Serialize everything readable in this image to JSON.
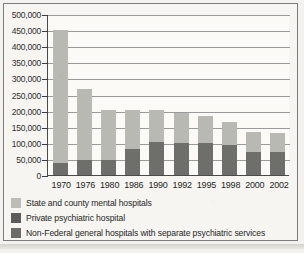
{
  "chart_data": {
    "type": "bar",
    "subtype": "stacked-bar",
    "title": "",
    "xlabel": "",
    "ylabel": "",
    "ylim": [
      0,
      500000
    ],
    "ytick_labels": [
      "500,000",
      "450,000",
      "400,000",
      "350,000",
      "300,000",
      "250,000",
      "200,000",
      "150,000",
      "100,000",
      "50,000",
      "0"
    ],
    "ytick_values": [
      500000,
      450000,
      400000,
      350000,
      300000,
      250000,
      200000,
      150000,
      100000,
      50000,
      0
    ],
    "grid": true,
    "legend_position": "below",
    "categories": [
      "1970",
      "1976",
      "1980",
      "1986",
      "1990",
      "1992",
      "1995",
      "1998",
      "2000",
      "2002"
    ],
    "series": [
      {
        "name": "Non-Federal general hospitals with separate psychiatric services",
        "color": "#6e6e6b",
        "values": [
          38000,
          48000,
          48000,
          80000,
          102000,
          99000,
          100000,
          93000,
          72000,
          73000
        ]
      },
      {
        "name": "State and county mental hospitals",
        "color": "#b9b9b4",
        "values": [
          412000,
          220000,
          155000,
          123000,
          101000,
          95000,
          83000,
          71000,
          63000,
          59000
        ]
      }
    ],
    "totals": [
      450000,
      268000,
      203000,
      203000,
      203000,
      194000,
      183000,
      164000,
      135000,
      132000
    ]
  },
  "legend": {
    "items": [
      {
        "label": "State and county mental hospitals",
        "color": "#bdbdb8"
      },
      {
        "label": "Private psychiatric hospital",
        "color": "#5c5c5a"
      },
      {
        "label": "Non-Federal general hospitals with separate psychiatric services",
        "color": "#6b6b68"
      }
    ]
  }
}
